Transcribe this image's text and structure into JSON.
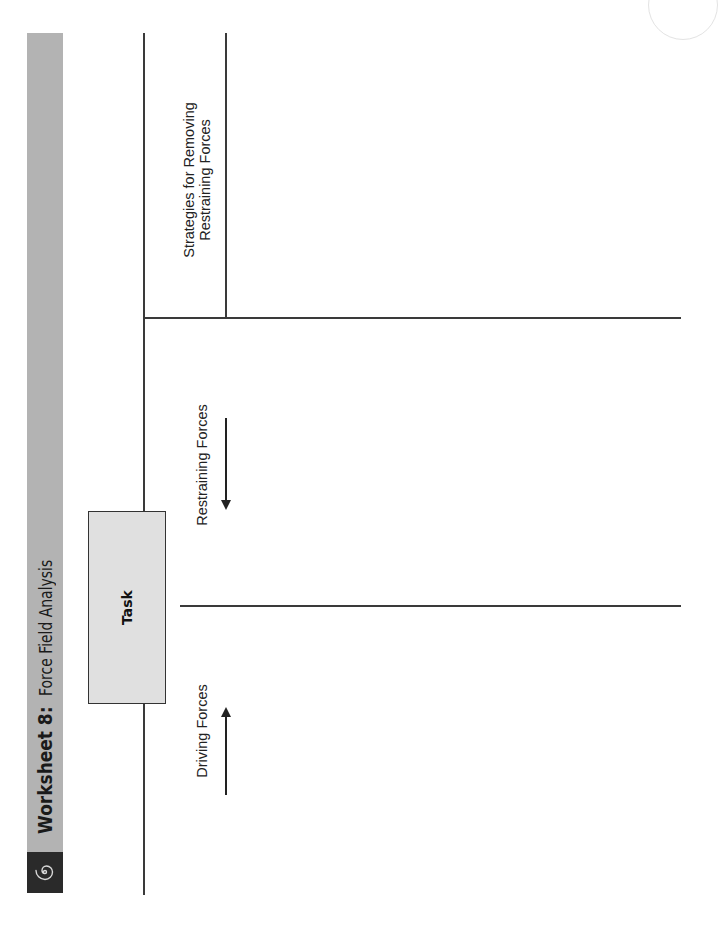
{
  "header": {
    "title_bold": "Worksheet 8:",
    "title_sub": "Force Field Analysis",
    "logo_icon": "spiral-icon",
    "band_color": "#b3b3b3",
    "logo_bg_color": "#2a2a2a"
  },
  "diagram": {
    "task_label": "Task",
    "columns": [
      {
        "label": "Driving Forces",
        "arrow_direction": "right"
      },
      {
        "label": "Restraining Forces",
        "arrow_direction": "left"
      },
      {
        "label_line1": "Strategies for Removing",
        "label_line2": "Restraining Forces"
      }
    ]
  }
}
